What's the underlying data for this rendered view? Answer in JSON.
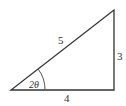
{
  "diagram": {
    "type": "right-triangle",
    "stroke_color": "#333333",
    "vertices": {
      "bottom_left": [
        11,
        90
      ],
      "bottom_right": [
        114,
        90
      ],
      "top_right": [
        114,
        10
      ]
    },
    "labels": {
      "hypotenuse": "5",
      "vertical_side": "3",
      "base": "4",
      "angle": "2θ"
    }
  }
}
